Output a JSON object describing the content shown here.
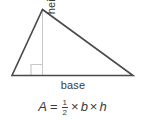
{
  "figure": {
    "type": "geometry-diagram",
    "shape": "triangle",
    "background_color": "#ffffff",
    "outline_color": "#4a4a4a",
    "height_line_color": "#c8c8c8",
    "text_color": "#3a3a3a",
    "labels": {
      "height": "height",
      "base": "base"
    },
    "markers": {
      "right_angle": "right-angle-square"
    },
    "vertices": {
      "apex": [
        42,
        9
      ],
      "left": [
        12,
        76
      ],
      "right": [
        133,
        76
      ]
    },
    "height_foot": [
      42,
      76
    ]
  },
  "formula": {
    "result_variable": "A",
    "equals": "=",
    "fraction_numerator": "1",
    "fraction_denominator": "2",
    "times_1": "×",
    "base_variable": "b",
    "times_2": "×",
    "height_variable": "h",
    "full_text": "A = 1/2 × b × h"
  }
}
